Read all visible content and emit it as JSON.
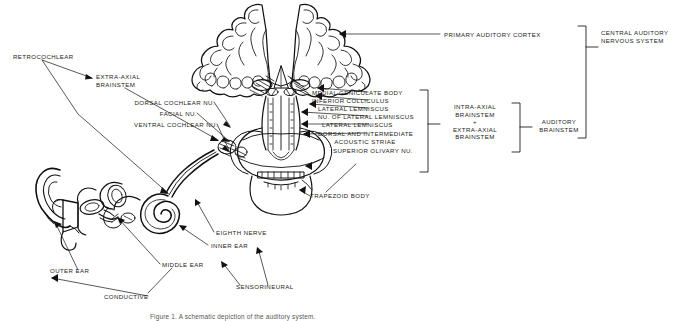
{
  "figure": {
    "caption": "Figure 1. A schematic depiction of the auditory system.",
    "ink_color": "#111111",
    "background_color": "#ffffff",
    "width": 695,
    "height": 321
  },
  "labels": {
    "retrocochlear": "RETROCOCHLEAR",
    "extra_axial_brainstem": "EXTRA-AXIAL\nBRAINSTEM",
    "dorsal_cochlear_nu": "DORSAL COCHLEAR NU.",
    "facial_nu": "FACIAL NU.",
    "ventral_cochlear_nu": "VENTRAL COCHLEAR NU.",
    "primary_auditory_cortex": "PRIMARY AUDITORY CORTEX",
    "medial_geniculate_body": "MEDIAL GENICULATE BODY",
    "inferior_colliculus": "INFERIOR COLLICULUS",
    "lateral_lemniscus_1": "LATERAL LEMNISCUS",
    "nu_of_lateral_lemniscus": "NU. OF LATERAL LEMNISCUS",
    "lateral_lemniscus_2": "LATERAL LEMNISCUS",
    "dorsal_and_intermediate": "DORSAL AND INTERMEDIATE",
    "acoustic_striae": "ACOUSTIC STRIAE",
    "superior_olivary_nu": "SUPERIOR OLIVARY NU.",
    "trapezoid_body": "TRAPEZOID BODY",
    "intra_extra_axial_brainstem": "INTRA-AXIAL\nBRAINSTEM\n+\nEXTRA-AXIAL\nBRAINSTEM",
    "auditory_brainstem": "AUDITORY\nBRAINSTEM",
    "central_auditory_nervous_system": "CENTRAL AUDITORY\nNERVOUS SYSTEM",
    "eighth_nerve": "EIGHTH NERVE",
    "inner_ear": "INNER EAR",
    "middle_ear": "MIDDLE EAR",
    "outer_ear": "OUTER EAR",
    "conductive": "CONDUCTIVE",
    "sensorineural": "SENSORINEURAL"
  }
}
